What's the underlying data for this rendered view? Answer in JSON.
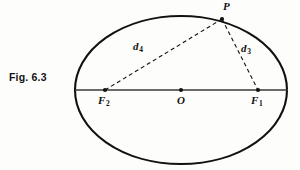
{
  "figure": {
    "caption": "Fig. 6.3",
    "background_color": "#fdfdfc",
    "ink_color": "#111111"
  },
  "diagram": {
    "type": "ellipse-with-foci",
    "ellipse": {
      "center_x": 181,
      "center_y": 90,
      "semi_major_a": 106,
      "semi_minor_b": 74,
      "stroke_width": 2.1,
      "stroke_color": "#111111"
    },
    "major_axis": {
      "x1": 75,
      "y1": 90,
      "x2": 288,
      "y2": 90,
      "stroke_width": 1.6,
      "stroke_color": "#3a3a3a"
    },
    "points": [
      {
        "id": "P",
        "label": "P",
        "sub": "",
        "x": 222,
        "y": 19,
        "dot_radius": 2.1
      },
      {
        "id": "O",
        "label": "O",
        "sub": "",
        "x": 181,
        "y": 90,
        "dot_radius": 2.1
      },
      {
        "id": "F1",
        "label": "F",
        "sub": "1",
        "x": 258,
        "y": 90,
        "dot_radius": 2.1
      },
      {
        "id": "F2",
        "label": "F",
        "sub": "2",
        "x": 105,
        "y": 90,
        "dot_radius": 2.1
      }
    ],
    "focal_radii": [
      {
        "id": "d4",
        "label": "d",
        "sub": "4",
        "from": "F2",
        "to": "P",
        "x1": 105,
        "y1": 90,
        "x2": 222,
        "y2": 19,
        "dash": "4 3",
        "stroke_width": 1.1
      },
      {
        "id": "d3",
        "label": "d",
        "sub": "3",
        "from": "P",
        "to": "F1",
        "x1": 222,
        "y1": 19,
        "x2": 258,
        "y2": 90,
        "dash": "4 3",
        "stroke_width": 1.1
      }
    ]
  },
  "labels": {
    "P": "P",
    "O": "O",
    "F": "F",
    "d": "d",
    "sub_1": "1",
    "sub_2": "2",
    "sub_3": "3",
    "sub_4": "4"
  }
}
